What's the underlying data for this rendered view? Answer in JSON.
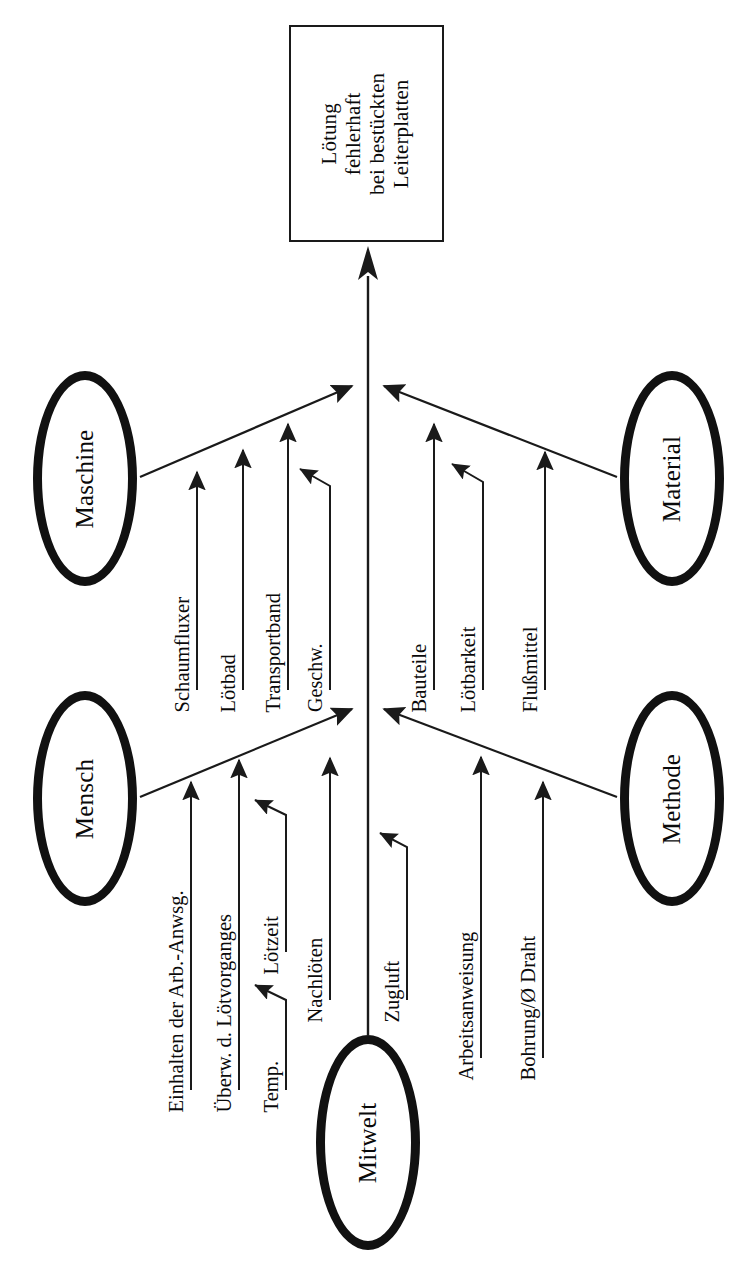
{
  "diagram": {
    "type": "ishikawa-fishbone",
    "orientation": "rotated-90-ccw",
    "title": "",
    "effect": {
      "label": "Lötung\nfehlerhaft\nbei bestückten\nLeiterplatten",
      "lines": [
        "Lötung",
        "fehlerhaft",
        "bei bestückten",
        "Leiterplatten"
      ]
    },
    "categories": [
      {
        "id": "maschine",
        "label": "Maschine",
        "side": "left-upper",
        "causes": [
          {
            "label": "Schaumfluxer",
            "sub": []
          },
          {
            "label": "Lötbad",
            "sub": []
          },
          {
            "label": "Transportband",
            "sub": [
              {
                "label": "Geschw."
              }
            ]
          }
        ]
      },
      {
        "id": "material",
        "label": "Material",
        "side": "right-upper",
        "causes": [
          {
            "label": "Bauteile",
            "sub": [
              {
                "label": "Lötbarkeit"
              }
            ]
          },
          {
            "label": "Flußmittel",
            "sub": []
          }
        ]
      },
      {
        "id": "mensch",
        "label": "Mensch",
        "side": "left-lower",
        "causes": [
          {
            "label": "Einhalten der Arb.-Anwsg.",
            "sub": []
          },
          {
            "label": "Überw. d. Lötvorganges",
            "sub": [
              {
                "label": "Lötzeit"
              },
              {
                "label": "Temp."
              }
            ]
          },
          {
            "label": "Nachlöten",
            "sub": []
          }
        ]
      },
      {
        "id": "methode",
        "label": "Methode",
        "side": "right-lower",
        "causes": [
          {
            "label": "Arbeitsanweisung",
            "sub": []
          },
          {
            "label": "Bohrung/Ø Draht",
            "sub": []
          }
        ]
      },
      {
        "id": "mitwelt",
        "label": "Mitwelt",
        "side": "spine-end",
        "causes": [
          {
            "label": "Zugluft",
            "sub": []
          }
        ]
      }
    ],
    "colors": {
      "line": "#1a1a1a",
      "ellipse_border": "#111111",
      "background": "#ffffff",
      "text": "#0a0a0a"
    }
  },
  "labels": {
    "effect": "Lötung\nfehlerhaft\nbei bestückten\nLeiterplatten",
    "maschine": "Maschine",
    "material": "Material",
    "mensch": "Mensch",
    "methode": "Methode",
    "mitwelt": "Mitwelt",
    "schaumfluxer": "Schaumfluxer",
    "loetbad": "Lötbad",
    "transportband": "Transportband",
    "geschw": "Geschw.",
    "bauteile": "Bauteile",
    "loetbarkeit": "Lötbarkeit",
    "flussmittel": "Flußmittel",
    "einhalten": "Einhalten der Arb.-Anwsg.",
    "ueberw": "Überw. d. Lötvorganges",
    "loetzeit": "Lötzeit",
    "temp": "Temp.",
    "nachloeten": "Nachlöten",
    "arbeitsanweisung": "Arbeitsanweisung",
    "bohrung": "Bohrung/Ø Draht",
    "zugluft": "Zugluft"
  }
}
